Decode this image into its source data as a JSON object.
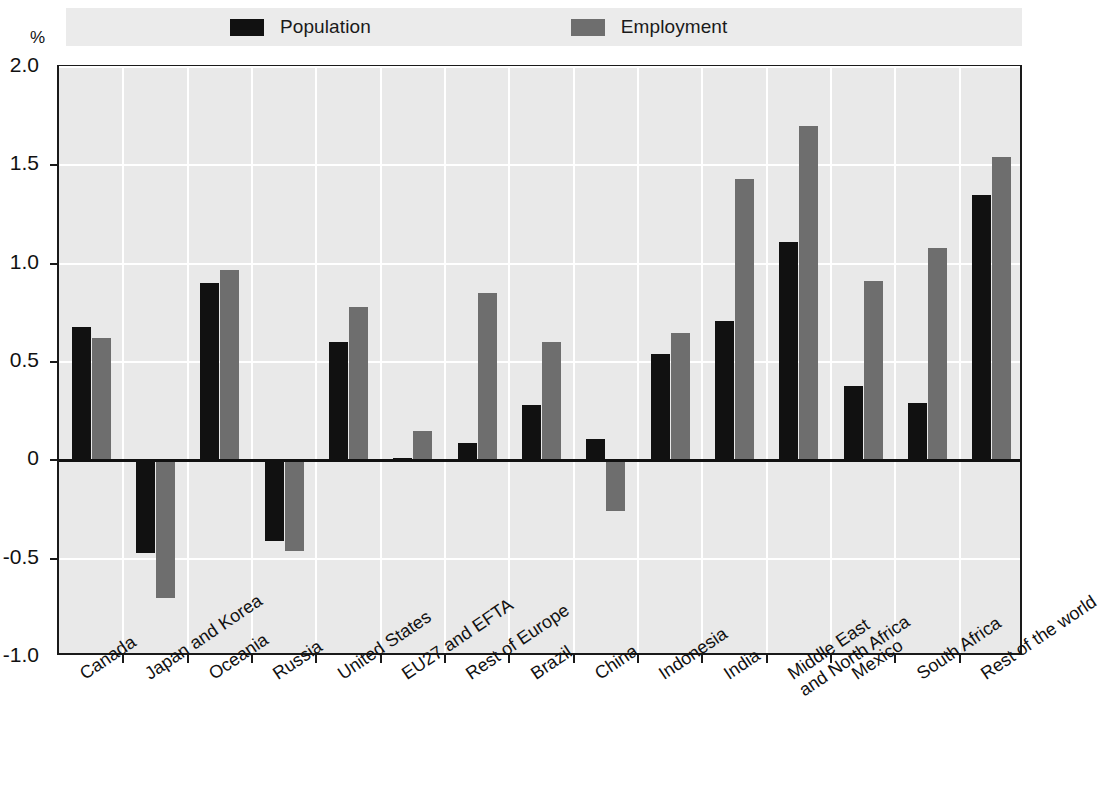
{
  "legend": {
    "items": [
      {
        "label": "Population",
        "color": "#111111",
        "icon": "legend-swatch-population"
      },
      {
        "label": "Employment",
        "color": "#6e6e6e",
        "icon": "legend-swatch-employment"
      }
    ]
  },
  "axis": {
    "y_unit": "%",
    "y_ticks": [
      "2.0",
      "1.5",
      "1.0",
      "0.5",
      "0",
      "-0.5",
      "-1.0"
    ]
  },
  "chart_data": {
    "type": "bar",
    "title": "",
    "subtitle": "",
    "xlabel": "",
    "ylabel": "%",
    "ylim": [
      -1.0,
      2.0
    ],
    "ytick_values": [
      2.0,
      1.5,
      1.0,
      0.5,
      0,
      -0.5,
      -1.0
    ],
    "grid": true,
    "legend_position": "top",
    "categories": [
      "Canada",
      "Japan and Korea",
      "Oceania",
      "Russia",
      "United States",
      "EU27 and EFTA",
      "Rest of Europe",
      "Brazil",
      "China",
      "Indonesia",
      "India",
      "Middle East\nand North Africa",
      "Mexico",
      "South Africa",
      "Rest of the world"
    ],
    "series": [
      {
        "name": "Population",
        "color": "#111111",
        "values": [
          0.68,
          -0.47,
          0.9,
          -0.41,
          0.6,
          0.01,
          0.09,
          0.28,
          0.11,
          0.54,
          0.71,
          1.11,
          0.38,
          0.29,
          1.35
        ]
      },
      {
        "name": "Employment",
        "color": "#6e6e6e",
        "values": [
          0.62,
          -0.7,
          0.97,
          -0.46,
          0.78,
          0.15,
          0.85,
          0.6,
          -0.26,
          0.65,
          1.43,
          1.7,
          0.91,
          1.08,
          1.54
        ]
      }
    ]
  }
}
